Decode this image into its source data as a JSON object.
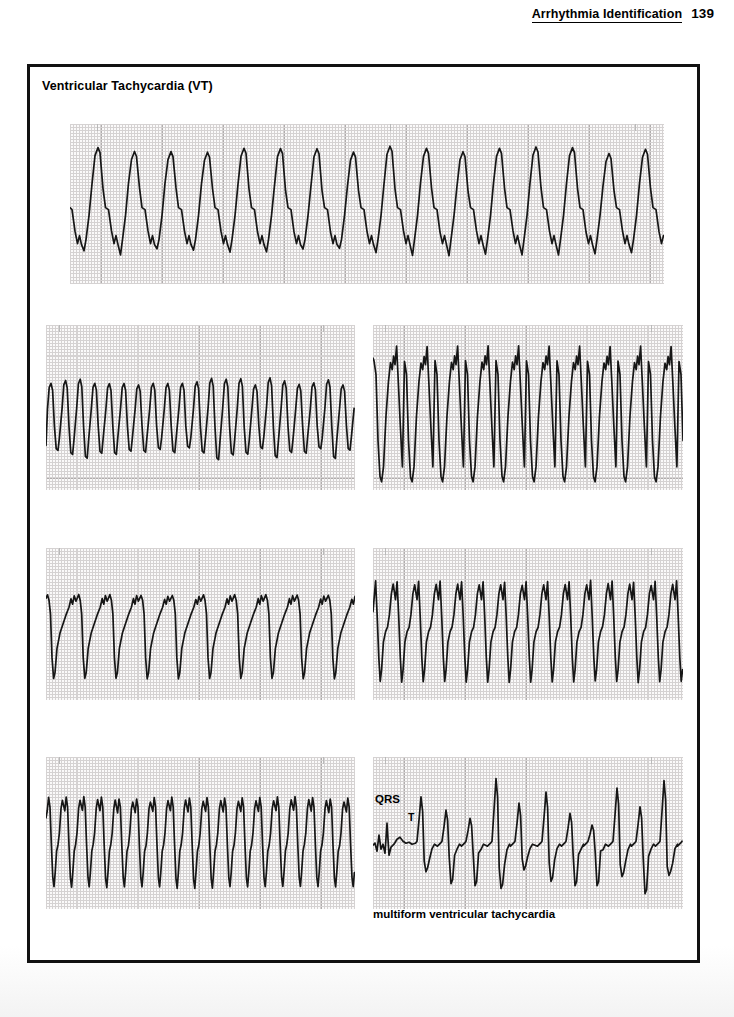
{
  "header": {
    "book_section_title": "Arrhythmia Identification",
    "page_number": "139"
  },
  "content_box": {
    "title": "Ventricular Tachycardia (VT)"
  },
  "annotations": {
    "qrs_label": "QRS",
    "t_label": "T"
  },
  "caption": {
    "multiform_vt": "multiform ventricular tachycardia"
  },
  "colors": {
    "ink": "#161616",
    "border": "#111111",
    "grid_fine": "#d5d2d2",
    "grid_major": "#b0acac",
    "paper": "#fbfafa"
  },
  "chart_data": {
    "type": "line",
    "title": "Ventricular Tachycardia (VT)",
    "xlabel": "",
    "ylabel": "",
    "grid": "on",
    "legend": "none",
    "strips": [
      {
        "id": "strip-1",
        "name": "wide-complex-vt-top",
        "label": "",
        "rate_bpm_estimate": 180,
        "morphology": "uniform wide QRS complexes, large positive deflection with deep notched trough",
        "beat_count": 16,
        "points": [
          [
            0,
            52
          ],
          [
            3,
            44
          ],
          [
            6,
            58
          ],
          [
            9,
            84
          ],
          [
            12,
            100
          ],
          [
            15,
            104
          ],
          [
            17,
            95
          ],
          [
            19,
            104
          ],
          [
            22,
            112
          ],
          [
            24,
            99
          ],
          [
            26,
            78
          ],
          [
            30,
            52
          ],
          [
            33,
            30
          ],
          [
            35,
            22
          ],
          [
            37,
            30
          ],
          [
            40,
            55
          ],
          [
            43,
            82
          ],
          [
            45,
            104
          ],
          [
            47,
            124
          ],
          [
            49,
            106
          ],
          [
            51,
            96
          ],
          [
            53,
            104
          ],
          [
            55,
            112
          ],
          [
            57,
            98
          ],
          [
            60,
            72
          ],
          [
            63,
            48
          ],
          [
            66,
            28
          ],
          [
            68,
            21
          ],
          [
            70,
            30
          ],
          [
            73,
            56
          ],
          [
            76,
            84
          ],
          [
            78,
            103
          ],
          [
            80,
            116
          ],
          [
            82,
            102
          ],
          [
            84,
            94
          ],
          [
            86,
            103
          ],
          [
            88,
            110
          ],
          [
            91,
            92
          ],
          [
            94,
            66
          ],
          [
            97,
            44
          ],
          [
            100,
            31
          ],
          [
            102,
            38
          ],
          [
            104,
            28
          ],
          [
            106,
            34
          ],
          [
            109,
            58
          ],
          [
            112,
            82
          ],
          [
            114,
            100
          ],
          [
            116,
            114
          ],
          [
            118,
            100
          ],
          [
            120,
            92
          ],
          [
            122,
            100
          ],
          [
            124,
            108
          ],
          [
            127,
            88
          ],
          [
            130,
            62
          ],
          [
            133,
            42
          ],
          [
            136,
            30
          ],
          [
            138,
            26
          ],
          [
            140,
            34
          ],
          [
            143,
            60
          ],
          [
            146,
            84
          ],
          [
            148,
            100
          ],
          [
            150,
            112
          ],
          [
            152,
            98
          ],
          [
            154,
            90
          ],
          [
            156,
            98
          ],
          [
            158,
            106
          ],
          [
            161,
            86
          ],
          [
            164,
            60
          ],
          [
            167,
            40
          ],
          [
            169,
            33
          ],
          [
            171,
            40
          ],
          [
            174,
            36
          ],
          [
            176,
            42
          ],
          [
            179,
            66
          ],
          [
            182,
            88
          ],
          [
            184,
            102
          ],
          [
            186,
            112
          ],
          [
            188,
            100
          ],
          [
            190,
            92
          ],
          [
            192,
            100
          ],
          [
            194,
            108
          ],
          [
            197,
            88
          ],
          [
            200,
            62
          ],
          [
            203,
            44
          ],
          [
            205,
            37
          ],
          [
            207,
            44
          ],
          [
            210,
            68
          ],
          [
            213,
            88
          ],
          [
            215,
            100
          ],
          [
            217,
            110
          ],
          [
            219,
            98
          ],
          [
            221,
            90
          ],
          [
            223,
            98
          ],
          [
            225,
            106
          ],
          [
            228,
            86
          ],
          [
            231,
            60
          ],
          [
            234,
            40
          ],
          [
            236,
            33
          ],
          [
            238,
            40
          ],
          [
            241,
            64
          ],
          [
            244,
            86
          ],
          [
            246,
            100
          ],
          [
            248,
            112
          ],
          [
            250,
            98
          ],
          [
            252,
            90
          ],
          [
            254,
            98
          ],
          [
            256,
            106
          ],
          [
            259,
            86
          ],
          [
            262,
            60
          ],
          [
            265,
            38
          ],
          [
            267,
            30
          ],
          [
            269,
            36
          ],
          [
            272,
            24
          ],
          [
            274,
            30
          ],
          [
            277,
            58
          ],
          [
            280,
            86
          ],
          [
            282,
            104
          ],
          [
            284,
            126
          ],
          [
            286,
            106
          ],
          [
            288,
            96
          ],
          [
            290,
            104
          ],
          [
            292,
            112
          ],
          [
            295,
            90
          ],
          [
            298,
            62
          ],
          [
            301,
            40
          ],
          [
            304,
            28
          ],
          [
            306,
            22
          ],
          [
            308,
            30
          ],
          [
            311,
            56
          ],
          [
            314,
            84
          ],
          [
            316,
            103
          ],
          [
            318,
            118
          ],
          [
            320,
            102
          ],
          [
            322,
            94
          ],
          [
            324,
            102
          ],
          [
            326,
            110
          ],
          [
            329,
            90
          ],
          [
            332,
            64
          ],
          [
            335,
            44
          ],
          [
            337,
            36
          ],
          [
            339,
            44
          ],
          [
            342,
            68
          ],
          [
            345,
            88
          ],
          [
            347,
            102
          ],
          [
            349,
            112
          ],
          [
            351,
            100
          ],
          [
            353,
            92
          ],
          [
            355,
            100
          ],
          [
            357,
            108
          ],
          [
            360,
            88
          ],
          [
            363,
            62
          ],
          [
            366,
            42
          ],
          [
            369,
            34
          ],
          [
            371,
            42
          ],
          [
            374,
            66
          ],
          [
            377,
            88
          ],
          [
            379,
            102
          ],
          [
            381,
            110
          ],
          [
            383,
            98
          ],
          [
            385,
            90
          ],
          [
            387,
            98
          ],
          [
            389,
            106
          ],
          [
            392,
            86
          ],
          [
            395,
            60
          ],
          [
            398,
            40
          ],
          [
            401,
            32
          ],
          [
            403,
            40
          ],
          [
            406,
            64
          ],
          [
            409,
            86
          ],
          [
            411,
            100
          ],
          [
            413,
            112
          ],
          [
            415,
            98
          ],
          [
            417,
            90
          ],
          [
            419,
            98
          ],
          [
            421,
            106
          ],
          [
            424,
            86
          ],
          [
            427,
            60
          ],
          [
            430,
            40
          ],
          [
            433,
            30
          ],
          [
            435,
            24
          ],
          [
            437,
            32
          ],
          [
            440,
            58
          ],
          [
            443,
            86
          ],
          [
            445,
            104
          ],
          [
            447,
            122
          ],
          [
            449,
            104
          ],
          [
            451,
            94
          ],
          [
            453,
            102
          ],
          [
            455,
            110
          ],
          [
            458,
            90
          ],
          [
            461,
            62
          ],
          [
            464,
            42
          ],
          [
            466,
            34
          ],
          [
            468,
            42
          ],
          [
            471,
            66
          ],
          [
            474,
            88
          ],
          [
            476,
            102
          ],
          [
            478,
            112
          ],
          [
            480,
            100
          ],
          [
            482,
            92
          ],
          [
            484,
            100
          ],
          [
            486,
            108
          ],
          [
            489,
            88
          ],
          [
            492,
            62
          ],
          [
            495,
            42
          ],
          [
            498,
            33
          ],
          [
            500,
            40
          ],
          [
            503,
            64
          ],
          [
            506,
            86
          ],
          [
            508,
            100
          ],
          [
            510,
            110
          ],
          [
            512,
            98
          ],
          [
            514,
            90
          ],
          [
            516,
            98
          ],
          [
            518,
            106
          ],
          [
            521,
            86
          ],
          [
            524,
            60
          ],
          [
            527,
            40
          ],
          [
            530,
            31
          ],
          [
            532,
            38
          ],
          [
            535,
            62
          ],
          [
            538,
            84
          ],
          [
            540,
            100
          ],
          [
            542,
            110
          ],
          [
            544,
            96
          ],
          [
            546,
            88
          ],
          [
            548,
            96
          ],
          [
            550,
            104
          ],
          [
            553,
            84
          ],
          [
            556,
            58
          ],
          [
            559,
            38
          ],
          [
            562,
            30
          ],
          [
            564,
            38
          ],
          [
            567,
            62
          ],
          [
            570,
            84
          ],
          [
            572,
            100
          ],
          [
            574,
            110
          ],
          [
            576,
            98
          ],
          [
            578,
            90
          ],
          [
            580,
            96
          ],
          [
            582,
            104
          ],
          [
            585,
            84
          ],
          [
            588,
            58
          ],
          [
            591,
            38
          ],
          [
            593,
            32
          ],
          [
            595,
            40
          ]
        ]
      },
      {
        "id": "strip-2",
        "name": "rapid-sinusoidal-vt",
        "label": "",
        "rate_bpm_estimate": 250,
        "morphology": "very rapid narrow sinusoidal ventricular tachycardia",
        "beat_count": 20
      },
      {
        "id": "strip-3",
        "name": "wide-notched-vt",
        "label": "",
        "rate_bpm_estimate": 150,
        "morphology": "wide sawtooth complexes with notched positive peaks and steep downstroke",
        "beat_count": 10
      },
      {
        "id": "strip-4",
        "name": "negative-sawtooth-vt",
        "label": "",
        "rate_bpm_estimate": 160,
        "morphology": "flat-topped plateau with sharp negative deflection, sawtooth appearance",
        "beat_count": 10
      },
      {
        "id": "strip-5",
        "name": "sharp-peak-vt",
        "label": "",
        "rate_bpm_estimate": 200,
        "morphology": "tall sharp positive peaks with deep troughs",
        "beat_count": 14
      },
      {
        "id": "strip-6",
        "name": "irregular-rapid-vt",
        "label": "",
        "rate_bpm_estimate": 220,
        "morphology": "rapid irregular wide complexes with varying amplitude",
        "beat_count": 17
      },
      {
        "id": "strip-7",
        "name": "multiform-vt",
        "label": "multiform ventricular tachycardia",
        "rate_bpm_estimate": 170,
        "morphology": "multiform ventricular tachycardia with beat-to-beat changing QRS morphology; initial baseline beats labeled QRS and T",
        "beat_count": 12,
        "annotations": [
          "QRS",
          "T"
        ]
      }
    ]
  }
}
